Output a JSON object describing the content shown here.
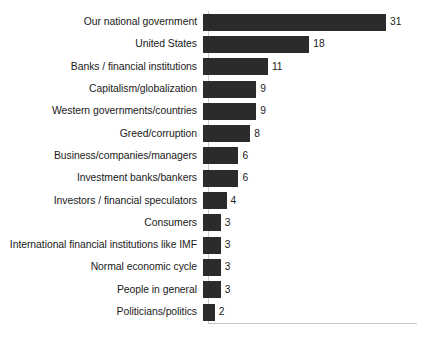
{
  "figure": {
    "clipped_title_fragment": "",
    "axis_color": "#c9c9cf",
    "bar_color": "#2b2b2b",
    "text_color": "#1a1a1a",
    "background": "#ffffff"
  },
  "chart_data": {
    "type": "bar",
    "orientation": "horizontal",
    "title": "",
    "subtitle": "",
    "xlabel": "",
    "ylabel": "",
    "xlim": [
      0,
      31
    ],
    "grid": false,
    "legend": false,
    "sorted": "descending",
    "value_labels": true,
    "categories": [
      "Our national government",
      "United States",
      "Banks / financial institutions",
      "Capitalism/globalization",
      "Western governments/countries",
      "Greed/corruption",
      "Business/companies/managers",
      "Investment banks/bankers",
      "Investors / financial speculators",
      "Consumers",
      "International financial institutions like IMF",
      "Normal economic cycle",
      "People in general",
      "Politicians/politics"
    ],
    "values": [
      31,
      18,
      11,
      9,
      9,
      8,
      6,
      6,
      4,
      3,
      3,
      3,
      3,
      2
    ],
    "value_label_text": [
      "31",
      "18",
      "11",
      "9",
      "9",
      "8",
      "6",
      "6",
      "4",
      "3",
      "3",
      "3",
      "3",
      "2"
    ]
  }
}
